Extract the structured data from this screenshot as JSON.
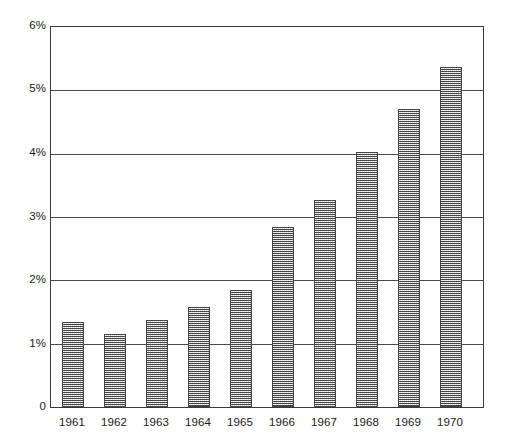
{
  "chart_data": {
    "type": "bar",
    "title": "",
    "subtitle": "",
    "xlabel": "",
    "ylabel": "",
    "categories": [
      "1961",
      "1962",
      "1963",
      "1964",
      "1965",
      "1966",
      "1967",
      "1968",
      "1969",
      "1970"
    ],
    "values": [
      1.35,
      1.15,
      1.37,
      1.58,
      1.85,
      2.84,
      3.27,
      4.02,
      4.71,
      5.37
    ],
    "value_unit": "%",
    "ylim": [
      0,
      6
    ],
    "ytick_values": [
      0,
      1,
      2,
      3,
      4,
      5,
      6
    ],
    "ytick_labels": [
      "0",
      "1%",
      "2%",
      "3%",
      "4%",
      "5%",
      "6%"
    ],
    "grid": true,
    "grid_axis": "y",
    "legend": false,
    "legend_position": "none",
    "series": [
      {
        "name": "",
        "values": [
          1.35,
          1.15,
          1.37,
          1.58,
          1.85,
          2.84,
          3.27,
          4.02,
          4.71,
          5.37
        ]
      }
    ],
    "bar_fill": "#d8d8d8",
    "bar_edge": "#454545",
    "axis_color": "#3a3a3a",
    "background": "#ffffff"
  },
  "axes": {
    "y_ticks": [
      {
        "label": "6%",
        "value": 6
      },
      {
        "label": "5%",
        "value": 5
      },
      {
        "label": "4%",
        "value": 4
      },
      {
        "label": "3%",
        "value": 3
      },
      {
        "label": "2%",
        "value": 2
      },
      {
        "label": "1%",
        "value": 1
      },
      {
        "label": "0",
        "value": 0
      }
    ],
    "x_ticks": [
      {
        "label": "1961"
      },
      {
        "label": "1962"
      },
      {
        "label": "1963"
      },
      {
        "label": "1964"
      },
      {
        "label": "1965"
      },
      {
        "label": "1966"
      },
      {
        "label": "1967"
      },
      {
        "label": "1968"
      },
      {
        "label": "1969"
      },
      {
        "label": "1970"
      }
    ]
  }
}
